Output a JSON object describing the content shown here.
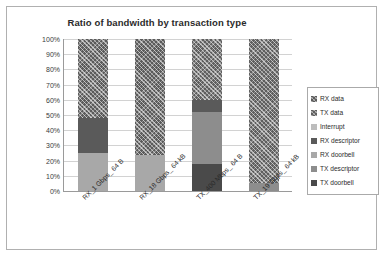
{
  "chart_data": {
    "type": "bar",
    "subtype": "stacked-100-percent-column",
    "title": "Ratio of bandwidth by transaction type",
    "xlabel": "",
    "ylabel": "Proportion of traffic",
    "ylim": [
      0,
      100
    ],
    "ytick_labels": [
      "100%",
      "90%",
      "80%",
      "70%",
      "60%",
      "50%",
      "40%",
      "30%",
      "20%",
      "10%",
      "0%"
    ],
    "ytick_values": [
      100,
      90,
      80,
      70,
      60,
      50,
      40,
      30,
      20,
      10,
      0
    ],
    "grid": true,
    "legend_position": "right",
    "categories": [
      "RX_1 Gbps_ 64 B",
      "RX_18 Gbps_ 64 kB",
      "TX_400 Mbps_ 64 B",
      "TX_19 Gbps_ 64 kB"
    ],
    "series": [
      {
        "name": "RX data",
        "key": "rx-data",
        "color": "#5b5b5b",
        "values": [
          52,
          76,
          0,
          0
        ]
      },
      {
        "name": "TX data",
        "key": "tx-data",
        "color": "#5f5f5f",
        "values": [
          0,
          0,
          40,
          95
        ]
      },
      {
        "name": "Interrupt",
        "key": "interrupt",
        "color": "#bdbdbd",
        "values": [
          0,
          0,
          0,
          0
        ]
      },
      {
        "name": "RX descriptor",
        "key": "rx-descriptor",
        "color": "#5a5a5a",
        "values": [
          23,
          0,
          0,
          0
        ]
      },
      {
        "name": "RX doorbell",
        "key": "rx-doorbell",
        "color": "#a8a8a8",
        "values": [
          25,
          24,
          0,
          0
        ]
      },
      {
        "name": "TX descriptor",
        "key": "tx-descriptor",
        "color": "#8d8d8d",
        "values": [
          0,
          0,
          42,
          5
        ]
      },
      {
        "name": "TX doorbell",
        "key": "tx-doorbell",
        "color": "#4a4a4a",
        "values": [
          0,
          0,
          18,
          0
        ]
      }
    ],
    "stacks": [
      {
        "category": "RX_1 Gbps_ 64 B",
        "segments": [
          {
            "name": "RX doorbell",
            "key": "rx-doorbell",
            "from": 0,
            "to": 25
          },
          {
            "name": "RX descriptor",
            "key": "rx-descriptor",
            "from": 25,
            "to": 48
          },
          {
            "name": "RX data",
            "key": "rx-data",
            "from": 48,
            "to": 100
          }
        ]
      },
      {
        "category": "RX_18 Gbps_ 64 kB",
        "segments": [
          {
            "name": "RX doorbell",
            "key": "rx-doorbell",
            "from": 0,
            "to": 24
          },
          {
            "name": "RX data",
            "key": "rx-data",
            "from": 24,
            "to": 100
          }
        ]
      },
      {
        "category": "TX_400 Mbps_ 64 B",
        "segments": [
          {
            "name": "TX doorbell",
            "key": "tx-doorbell",
            "from": 0,
            "to": 18
          },
          {
            "name": "TX descriptor",
            "key": "tx-descriptor",
            "from": 18,
            "to": 52
          },
          {
            "name": "Interrupt",
            "key": "tx-desc-dark",
            "from": 52,
            "to": 60
          },
          {
            "name": "TX data",
            "key": "tx-data",
            "from": 60,
            "to": 100
          }
        ]
      },
      {
        "category": "TX_19 Gbps_ 64 kB",
        "segments": [
          {
            "name": "TX descriptor",
            "key": "tx-descriptor",
            "from": 0,
            "to": 5
          },
          {
            "name": "TX data",
            "key": "tx-data",
            "from": 5,
            "to": 100
          }
        ]
      }
    ]
  },
  "legend": {
    "items": [
      {
        "label": "RX data",
        "key": "rx-data"
      },
      {
        "label": "TX data",
        "key": "tx-data"
      },
      {
        "label": "Interrupt",
        "key": "interrupt"
      },
      {
        "label": "RX descriptor",
        "key": "rx-descriptor"
      },
      {
        "label": "RX doorbell",
        "key": "rx-doorbell"
      },
      {
        "label": "TX descriptor",
        "key": "tx-descriptor"
      },
      {
        "label": "TX doorbell",
        "key": "tx-doorbell"
      }
    ]
  }
}
